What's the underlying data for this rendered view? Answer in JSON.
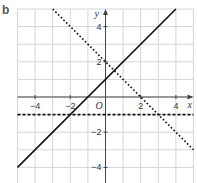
{
  "panel_label": "b",
  "chart_data": {
    "type": "line",
    "title": "",
    "xlabel": "x",
    "ylabel": "y",
    "origin_label": "O",
    "xlim": [
      -5,
      5
    ],
    "ylim": [
      -4.8,
      5
    ],
    "grid": true,
    "x_ticks": [
      -4,
      -2,
      2,
      4
    ],
    "y_ticks": [
      4,
      2,
      -2,
      -4
    ],
    "x_tick_labels": [
      "−4",
      "−2",
      "2",
      "4"
    ],
    "y_tick_labels": [
      "4",
      "2",
      "−2",
      "−4"
    ],
    "series": [
      {
        "name": "y = x + 1",
        "style": "solid",
        "points": [
          [
            -5,
            -4
          ],
          [
            4,
            5
          ]
        ]
      },
      {
        "name": "y = -x + 2",
        "style": "dotted",
        "points": [
          [
            -3,
            5
          ],
          [
            5,
            -3
          ]
        ]
      },
      {
        "name": "y = -1",
        "style": "dashed",
        "points": [
          [
            -5,
            -1
          ],
          [
            5,
            -1
          ]
        ]
      }
    ]
  },
  "colors": {
    "grid": "#d6d6d6",
    "axis": "#444444",
    "line": "#111111",
    "label": "#555a4a"
  }
}
